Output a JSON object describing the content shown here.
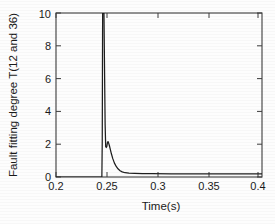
{
  "chart_data": {
    "type": "line",
    "title": "",
    "xlabel": "Time(s)",
    "ylabel": "Fault fitting degree T(12 and 36)",
    "xlim": [
      0.2,
      0.4147
    ],
    "ylim": [
      0,
      10
    ],
    "grid": false,
    "legend": null,
    "xticks": [
      0.2,
      0.25,
      0.3,
      0.35,
      0.4
    ],
    "xticklabels": [
      "0.2",
      "0.25",
      "0.3",
      "0.35",
      "0.4"
    ],
    "yticks": [
      0,
      2,
      4,
      6,
      8,
      10
    ],
    "yticklabels": [
      "0",
      "2",
      "4",
      "6",
      "8",
      "10"
    ],
    "line_color": "#1e1e1e",
    "series": [
      {
        "name": "T(12 and 36)",
        "x": [
          0.2,
          0.22,
          0.24,
          0.246,
          0.2478,
          0.2482,
          0.2484,
          0.2486,
          0.2488,
          0.2492,
          0.2496,
          0.25,
          0.2506,
          0.2512,
          0.2518,
          0.2524,
          0.253,
          0.2536,
          0.2542,
          0.2548,
          0.2556,
          0.2566,
          0.2578,
          0.2592,
          0.2608,
          0.2626,
          0.2646,
          0.2668,
          0.269,
          0.272,
          0.276,
          0.282,
          0.29,
          0.3,
          0.32,
          0.35,
          0.38,
          0.4,
          0.4147
        ],
        "y": [
          0.0,
          0.0,
          0.0,
          0.0,
          0.0,
          2.2,
          6.0,
          10.0,
          10.0,
          10.0,
          10.0,
          10.0,
          6.5,
          3.2,
          1.85,
          1.8,
          1.86,
          2.1,
          2.16,
          2.08,
          1.92,
          1.68,
          1.4,
          1.12,
          0.86,
          0.66,
          0.5,
          0.38,
          0.31,
          0.26,
          0.23,
          0.215,
          0.205,
          0.2,
          0.198,
          0.196,
          0.195,
          0.195,
          0.195
        ]
      }
    ]
  },
  "figure": {
    "plot_area": {
      "left": 56,
      "top": 13,
      "right": 262,
      "bottom": 177
    }
  }
}
